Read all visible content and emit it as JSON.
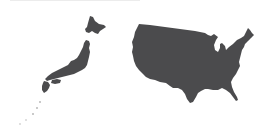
{
  "map": {
    "title": "",
    "regions": [
      {
        "name": "Japan",
        "label": "",
        "fill": "#4b4b4d"
      },
      {
        "name": "United States (contiguous)",
        "label": "",
        "fill": "#4b4b4d"
      }
    ],
    "background": "#ffffff"
  }
}
